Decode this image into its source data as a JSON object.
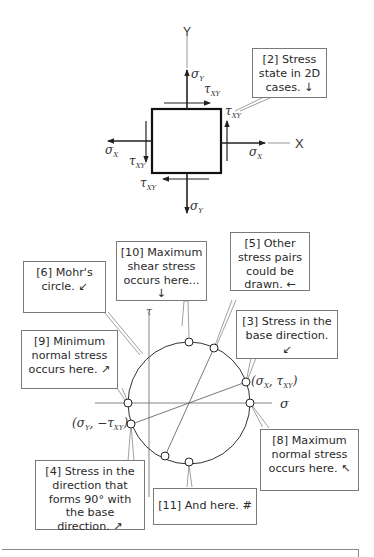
{
  "element_diagram": {
    "axis_y_label": "Y",
    "axis_x_label": "X",
    "labels": {
      "sigma_y_top": "σ",
      "sigma_y_top_sub": "Y",
      "tau_xy_top": "τ",
      "tau_xy_top_sub": "XY",
      "tau_xy_right": "τ",
      "tau_xy_right_sub": "XY",
      "sigma_x_right": "σ",
      "sigma_x_right_sub": "X",
      "sigma_x_left": "σ",
      "sigma_x_left_sub": "X",
      "tau_xy_left": "τ",
      "tau_xy_left_sub": "XY",
      "tau_xy_bottom": "τ",
      "tau_xy_bottom_sub": "XY",
      "sigma_y_bottom": "σ",
      "sigma_y_bottom_sub": "Y"
    }
  },
  "mohr_diagram": {
    "axis_sigma_label": "σ",
    "axis_tau_label": "τ",
    "point_x_label": "(σX, τXY)",
    "point_x": {
      "open": "(σ",
      "s1": "X",
      "mid": ", τ",
      "s2": "XY",
      "close": ")"
    },
    "point_y": {
      "open": "(σ",
      "s1": "Y",
      "mid": ", −τ",
      "s2": "XY",
      "close": ")"
    }
  },
  "callouts": [
    {
      "id": "2",
      "text": "[2] Stress state in 2D cases. ↓"
    },
    {
      "id": "10",
      "text": "[10] Maximum shear stress occurs here... ↓"
    },
    {
      "id": "5",
      "text": "[5] Other stress pairs could be drawn. ←"
    },
    {
      "id": "6",
      "text": "[6] Mohr's circle. ↙"
    },
    {
      "id": "3",
      "text": "[3] Stress in the base direction. ↙"
    },
    {
      "id": "9",
      "text": "[9] Minimum normal stress occurs here. ↗"
    },
    {
      "id": "8",
      "text": "[8] Maximum normal stress occurs here. ↖"
    },
    {
      "id": "4",
      "text": "[4] Stress in the direction that forms 90° with the base direction. ↗"
    },
    {
      "id": "11",
      "text": "[11] And here. #"
    }
  ]
}
